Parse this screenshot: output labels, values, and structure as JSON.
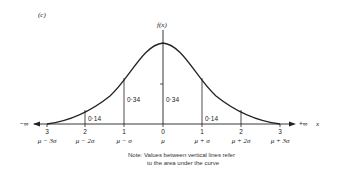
{
  "figure": {
    "panel_label": "(c)",
    "y_axis_label": "f(x)",
    "x_axis_label": "x",
    "left_infinity": "−∞",
    "right_infinity": "+∞",
    "ticks": [
      {
        "num": "3",
        "sym": "μ − 3σ"
      },
      {
        "num": "2",
        "sym": "μ − 2σ"
      },
      {
        "num": "1",
        "sym": "μ − σ"
      },
      {
        "num": "0",
        "sym": "μ"
      },
      {
        "num": "1",
        "sym": "μ + σ"
      },
      {
        "num": "2",
        "sym": "μ + 2σ"
      },
      {
        "num": "3",
        "sym": "μ + 3σ"
      }
    ],
    "areas": {
      "left_outer": "0·14",
      "left_inner": "0·34",
      "right_inner": "0·34",
      "right_outer": "0·14"
    },
    "note_line1": "Note: Values between vertical lines refer",
    "note_line2": "to the area under the curve",
    "line_color": "#222222"
  }
}
